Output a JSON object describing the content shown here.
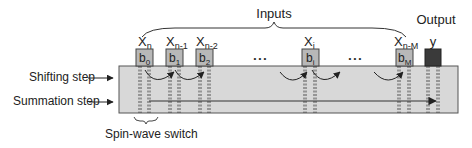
{
  "diagram": {
    "inputs_label": "Inputs",
    "output_label": "Output",
    "cells": [
      {
        "var": "X",
        "sub": "n",
        "bit": "b",
        "bit_sub": "0",
        "x": 137
      },
      {
        "var": "X",
        "sub": "n-1",
        "bit": "b",
        "bit_sub": "1",
        "x": 167
      },
      {
        "var": "X",
        "sub": "n-2",
        "bit": "b",
        "bit_sub": "2",
        "x": 197
      },
      {
        "var": "X",
        "sub": "i",
        "bit": "b",
        "bit_sub": "i",
        "x": 302
      },
      {
        "var": "X",
        "sub": "n-M",
        "bit": "b",
        "bit_sub": "M",
        "x": 396
      }
    ],
    "output_cell": {
      "label": "y"
    },
    "ellipsis": "• • •",
    "left_labels": {
      "shifting": "Shifting step",
      "summation": "Summation step"
    },
    "bottom_label": "Spin-wave switch",
    "colors": {
      "waveguide_fill": "#d8d8d8",
      "cell_fill": "#b8b8b8",
      "output_fill": "#3a3a3a",
      "stroke": "#444444"
    }
  }
}
